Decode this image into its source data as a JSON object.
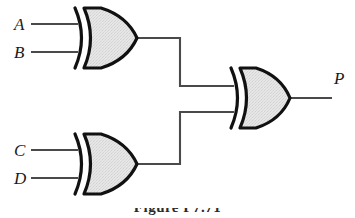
{
  "figure": {
    "kind": "logic-circuit-diagram",
    "background_color": "#ffffff",
    "caption": "Figure  P7.71",
    "caption_visible_fraction": "top-edge-only"
  },
  "colors": {
    "wire": "#4a4a4a",
    "gate_outline": "#111111",
    "gate_fill": "#e4e4e4",
    "label_text": "#1a1a1a",
    "background": "#ffffff"
  },
  "inputs": [
    {
      "label": "A",
      "x": 14,
      "y": 16,
      "wire_y": 24,
      "wire_x1": 31,
      "wire_x2": 78
    },
    {
      "label": "B",
      "x": 14,
      "y": 44,
      "wire_y": 52,
      "wire_x1": 31,
      "wire_x2": 78
    },
    {
      "label": "C",
      "x": 14,
      "y": 142,
      "wire_y": 150,
      "wire_x1": 31,
      "wire_x2": 78
    },
    {
      "label": "D",
      "x": 14,
      "y": 170,
      "wire_y": 178,
      "wire_x1": 31,
      "wire_x2": 78
    }
  ],
  "outputs": [
    {
      "label": "P",
      "x": 334,
      "y": 70,
      "wire_y": 98,
      "wire_x1": 291,
      "wire_x2": 332
    }
  ],
  "gates": [
    {
      "id": "gate-xor-1",
      "type": "XOR",
      "type_label": "XOR",
      "inputs": [
        "A",
        "B"
      ],
      "output": "gate-xor-1-out",
      "x": 72,
      "y": 8,
      "width": 66,
      "height": 60,
      "output_point": {
        "x": 138,
        "y": 38
      }
    },
    {
      "id": "gate-xor-2",
      "type": "XOR",
      "type_label": "XOR",
      "inputs": [
        "C",
        "D"
      ],
      "output": "gate-xor-2-out",
      "x": 72,
      "y": 134,
      "width": 66,
      "height": 60,
      "output_point": {
        "x": 138,
        "y": 164
      }
    },
    {
      "id": "gate-xor-3",
      "type": "XOR",
      "type_label": "XOR",
      "inputs": [
        "gate-xor-1-out",
        "gate-xor-2-out"
      ],
      "output": "P",
      "x": 228,
      "y": 68,
      "width": 64,
      "height": 60,
      "output_point": {
        "x": 291,
        "y": 98
      }
    }
  ],
  "wires": [
    {
      "id": "wire-a-in",
      "from": "A",
      "to": "gate-xor-1",
      "points": "31,24 78,24"
    },
    {
      "id": "wire-b-in",
      "from": "B",
      "to": "gate-xor-1",
      "points": "31,52 78,52"
    },
    {
      "id": "wire-c-in",
      "from": "C",
      "to": "gate-xor-2",
      "points": "31,150 78,150"
    },
    {
      "id": "wire-d-in",
      "from": "D",
      "to": "gate-xor-2",
      "points": "31,178 78,178"
    },
    {
      "id": "wire-g1-to-g3",
      "from": "gate-xor-1",
      "to": "gate-xor-3",
      "points": "138,38 180,38 180,86 234,86"
    },
    {
      "id": "wire-g2-to-g3",
      "from": "gate-xor-2",
      "to": "gate-xor-3",
      "points": "138,164 180,164 180,112 234,112"
    },
    {
      "id": "wire-p-out",
      "from": "gate-xor-3",
      "to": "P",
      "points": "291,98 332,98"
    }
  ],
  "logic": {
    "expression": "P = (A XOR B) XOR (C XOR D)",
    "gate_count": 3,
    "input_count": 4,
    "output_count": 1
  }
}
